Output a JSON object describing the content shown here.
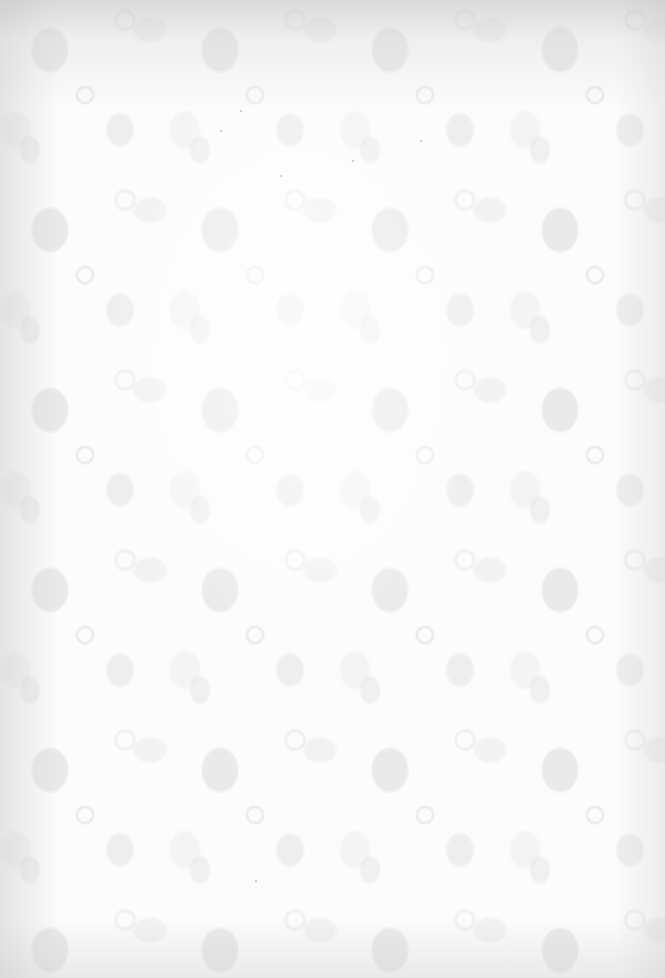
{
  "image": {
    "description": "Blank sheet of patterned paper with a faint pale-grey floral damask design; no text visible",
    "background_color": "#fcfcfc",
    "pattern_color": "#d2d2d2",
    "edge_color": "#bebebe"
  }
}
